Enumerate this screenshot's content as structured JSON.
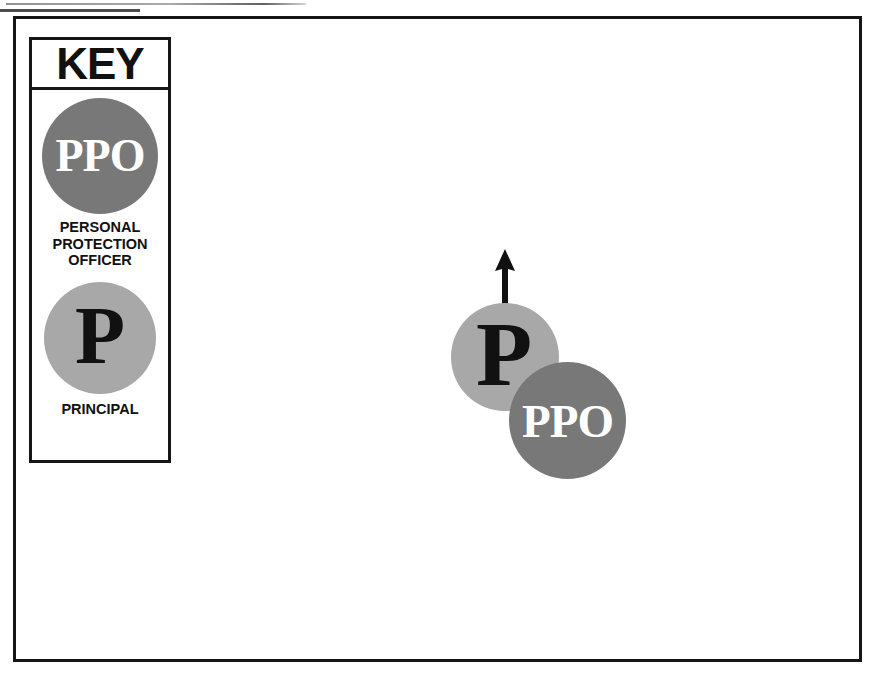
{
  "document": {
    "type": "protective-formation-diagram",
    "title": "KEY"
  },
  "legend": {
    "title": "KEY",
    "entries": [
      {
        "symbol": "PPO",
        "symbol_text": "PPO",
        "caption": "PERSONAL\nPROTECTION\nOFFICER",
        "caption_lines": [
          "PERSONAL",
          "PROTECTION",
          "OFFICER"
        ],
        "fill_color": "#787878",
        "text_color": "#ffffff"
      },
      {
        "symbol": "P",
        "symbol_text": "P",
        "caption": "PRINCIPAL",
        "caption_lines": [
          "PRINCIPAL"
        ],
        "fill_color": "#a8a8a8",
        "text_color": "#111111"
      }
    ]
  },
  "formation": {
    "units": [
      {
        "role": "principal",
        "symbol_text": "P",
        "fill_color": "#a8a8a8",
        "text_color": "#111111"
      },
      {
        "role": "personal-protection-officer",
        "symbol_text": "PPO",
        "fill_color": "#787878",
        "text_color": "#ffffff"
      }
    ],
    "direction_arrow": {
      "name": "movement-direction-arrow",
      "points": "up",
      "color": "#111111"
    }
  },
  "colors": {
    "ppo_fill": "#787878",
    "principal_fill": "#a8a8a8",
    "frame_stroke": "#161616",
    "background": "#ffffff"
  }
}
